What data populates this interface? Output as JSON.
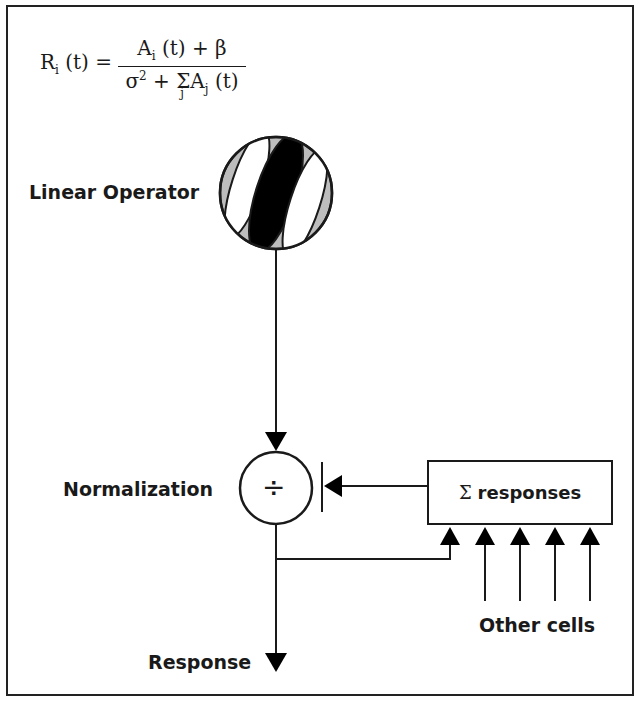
{
  "equation": {
    "lhs": "R",
    "lhs_sub": "i",
    "lhs_arg": "(t) =",
    "numerator": "A",
    "numerator_sub": "i",
    "numerator_rest": "(t) + β",
    "denominator_sigma": "σ",
    "denominator_sup": "2",
    "denominator_plus": "+",
    "denominator_sum": "Σ",
    "denominator_sum_index": "j",
    "denominator_A": "A",
    "denominator_A_sub": "j",
    "denominator_arg": "(t)"
  },
  "labels": {
    "linear_operator": "Linear Operator",
    "normalization": "Normalization",
    "divide_symbol": "÷",
    "sum_symbol": "Σ",
    "sum_responses": "responses",
    "other_cells": "Other cells",
    "response": "Response"
  },
  "colors": {
    "stroke": "#1a1a1a",
    "gray_fill": "#bdbdbd",
    "white": "#ffffff"
  }
}
